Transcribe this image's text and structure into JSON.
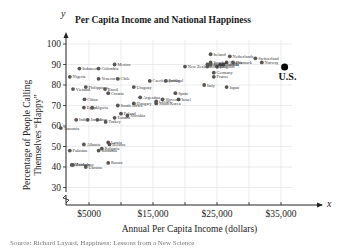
{
  "chart_data": {
    "type": "scatter",
    "title": "Per Capita Income and National Happiness",
    "xlabel": "Annual Per Capita Income (dollars)",
    "ylabel": "Percentage of People Calling Themselves “Happy”",
    "x_axis_symbol": "x",
    "y_axis_symbol": "y",
    "xlim": [
      0,
      38000
    ],
    "ylim": [
      25,
      100
    ],
    "x_ticks": [
      "$5000",
      "$15,000",
      "$25,000",
      "$35,000"
    ],
    "x_tick_values": [
      5000,
      15000,
      25000,
      35000
    ],
    "y_ticks": [
      "100",
      "90",
      "80",
      "70",
      "60",
      "50",
      "40",
      "30"
    ],
    "y_tick_values": [
      100,
      90,
      80,
      70,
      60,
      50,
      40,
      30
    ],
    "grid": true,
    "axis_break": "y-axis break near origin",
    "highlight": {
      "label": "U.S.",
      "x": 34000,
      "y": 82
    },
    "points": [
      {
        "label": "Nigeria",
        "x": 2000,
        "y": 84
      },
      {
        "label": "Vietnam",
        "x": 2500,
        "y": 78
      },
      {
        "label": "Indonesia",
        "x": 3500,
        "y": 88
      },
      {
        "label": "Colombia",
        "x": 6500,
        "y": 88
      },
      {
        "label": "Venezuela",
        "x": 6500,
        "y": 83
      },
      {
        "label": "Mexico",
        "x": 9000,
        "y": 90
      },
      {
        "label": "Chile",
        "x": 9500,
        "y": 83
      },
      {
        "label": "Philippines",
        "x": 4500,
        "y": 79
      },
      {
        "label": "Brazil",
        "x": 7500,
        "y": 78
      },
      {
        "label": "Croatia",
        "x": 8000,
        "y": 76
      },
      {
        "label": "China",
        "x": 4300,
        "y": 73
      },
      {
        "label": "Egypt",
        "x": 4200,
        "y": 69
      },
      {
        "label": "Algeria",
        "x": 5500,
        "y": 69
      },
      {
        "label": "India",
        "x": 3000,
        "y": 63
      },
      {
        "label": "Jordan",
        "x": 4800,
        "y": 63
      },
      {
        "label": "Iran",
        "x": 6300,
        "y": 63
      },
      {
        "label": "Turkey",
        "x": 7600,
        "y": 62
      },
      {
        "label": "Uruguay",
        "x": 12000,
        "y": 79
      },
      {
        "label": "Czech Republic",
        "x": 14500,
        "y": 82
      },
      {
        "label": "Portugal",
        "x": 17000,
        "y": 82
      },
      {
        "label": "New Zealand",
        "x": 20000,
        "y": 89
      },
      {
        "label": "Argentina",
        "x": 13000,
        "y": 74
      },
      {
        "label": "Hungary",
        "x": 12000,
        "y": 71
      },
      {
        "label": "South Africa",
        "x": 9500,
        "y": 70
      },
      {
        "label": "Slovakia",
        "x": 11000,
        "y": 65
      },
      {
        "label": "Poland",
        "x": 10000,
        "y": 66
      },
      {
        "label": "Estonia",
        "x": 9000,
        "y": 64
      },
      {
        "label": "Spain",
        "x": 18500,
        "y": 76
      },
      {
        "label": "Israel",
        "x": 19000,
        "y": 73
      },
      {
        "label": "Slovenia",
        "x": 16500,
        "y": 73
      },
      {
        "label": "South Korea",
        "x": 15500,
        "y": 71
      },
      {
        "label": "Greece",
        "x": 15500,
        "y": 72
      },
      {
        "label": "Latvia",
        "x": 8000,
        "y": 52
      },
      {
        "label": "Albania",
        "x": 4200,
        "y": 51
      },
      {
        "label": "Belarus",
        "x": 8200,
        "y": 51
      },
      {
        "label": "Romania",
        "x": 6500,
        "y": 48
      },
      {
        "label": "Bulgaria",
        "x": 7000,
        "y": 49
      },
      {
        "label": "Pakistan",
        "x": 2000,
        "y": 48
      },
      {
        "label": "Russia",
        "x": 8000,
        "y": 42
      },
      {
        "label": "Ukraine",
        "x": 4500,
        "y": 40
      },
      {
        "label": "Zimbabwe",
        "x": 2500,
        "y": 41
      },
      {
        "label": "Moldova",
        "x": 2300,
        "y": 41
      },
      {
        "label": "Tanzania",
        "x": 600,
        "y": 59
      },
      {
        "label": "Ireland",
        "x": 24000,
        "y": 95
      },
      {
        "label": "Netherlands",
        "x": 27000,
        "y": 94
      },
      {
        "label": "Switzerland",
        "x": 31000,
        "y": 93
      },
      {
        "label": "Norway",
        "x": 32000,
        "y": 91
      },
      {
        "label": "Italy",
        "x": 23000,
        "y": 80
      },
      {
        "label": "Japan",
        "x": 26500,
        "y": 79
      },
      {
        "label": "France",
        "x": 24500,
        "y": 84
      },
      {
        "label": "Canada",
        "x": 26500,
        "y": 91
      },
      {
        "label": "Denmark",
        "x": 27500,
        "y": 91
      },
      {
        "label": "Austria",
        "x": 26000,
        "y": 90
      },
      {
        "label": "Belgium",
        "x": 25000,
        "y": 89
      },
      {
        "label": "Australia",
        "x": 25500,
        "y": 90
      },
      {
        "label": "Germany",
        "x": 24500,
        "y": 86
      },
      {
        "label": "Finland",
        "x": 23500,
        "y": 90
      },
      {
        "label": "Sweden",
        "x": 24000,
        "y": 91
      },
      {
        "label": "Singapore",
        "x": 23500,
        "y": 89
      },
      {
        "label": "Britain",
        "x": 24000,
        "y": 90
      }
    ]
  },
  "caption": "Source: Richard Layard, Happiness: Lessons from a New Science"
}
